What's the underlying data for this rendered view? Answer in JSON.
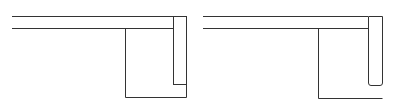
{
  "diagram": {
    "stroke_color": "#333333",
    "background": "#ffffff",
    "figures": [
      {
        "name": "left-figure",
        "top_rail": {
          "x1": 12,
          "x2": 186,
          "y_top": 16,
          "y_bottom": 28
        },
        "vertical_bar": {
          "x1": 173,
          "x2": 186,
          "y_top": 16,
          "y_bottom": 84,
          "corners": "square"
        },
        "box": {
          "x_left": 125,
          "x_right": 186,
          "y_top": 28,
          "y_bottom": 97
        }
      },
      {
        "name": "right-figure",
        "top_rail": {
          "x1": 203,
          "x2": 382,
          "y_top": 16,
          "y_bottom": 28
        },
        "vertical_bar": {
          "x1": 368,
          "x2": 382,
          "y_top": 16,
          "y_bottom": 85,
          "corners": "rounded"
        },
        "box": {
          "x_left": 318,
          "x_right": 382,
          "y_top": 28,
          "y_bottom": 98,
          "open_right": true
        }
      }
    ]
  }
}
